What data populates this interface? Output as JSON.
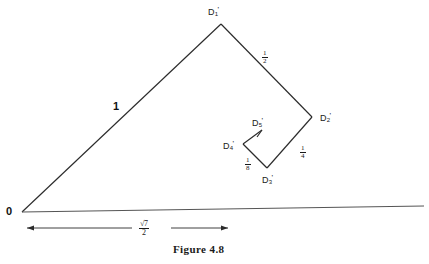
{
  "figure": {
    "caption": "Figure 4.8",
    "origin_label": "0"
  },
  "vertices": [
    {
      "name": "D1",
      "base": "D",
      "sub": "1",
      "prime": "'"
    },
    {
      "name": "D2",
      "base": "D",
      "sub": "2",
      "prime": "'"
    },
    {
      "name": "D3",
      "base": "D",
      "sub": "3",
      "prime": "'"
    },
    {
      "name": "D4",
      "base": "D",
      "sub": "4",
      "prime": "'"
    },
    {
      "name": "D5",
      "base": "D",
      "sub": "5",
      "prime": "'"
    }
  ],
  "edge_labels": {
    "hypotenuse": "1",
    "half": {
      "num": "1",
      "den": "2"
    },
    "quarter": {
      "num": "1",
      "den": "4"
    },
    "eighth": {
      "num": "1",
      "den": "8"
    }
  },
  "dimension": {
    "label": {
      "num": "√7",
      "den": "2"
    }
  },
  "colors": {
    "ink": "#1a1a1a",
    "background": "#ffffff",
    "baseline": "#555555"
  }
}
